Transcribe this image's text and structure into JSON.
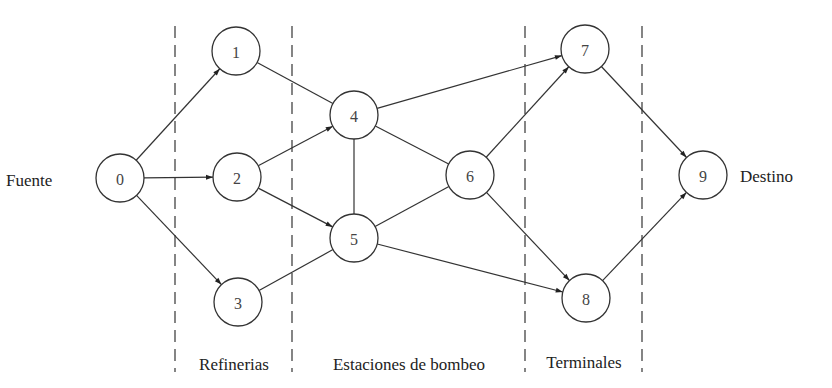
{
  "diagram": {
    "type": "network-flow",
    "source_label": "Fuente",
    "sink_label": "Destino",
    "stages": [
      {
        "label": "Refinerias",
        "x": 234
      },
      {
        "label": "Estaciones de bombeo",
        "x": 409
      },
      {
        "label": "Terminales",
        "x": 584
      }
    ],
    "dividers_x": [
      175,
      292,
      525,
      642
    ],
    "nodes": [
      {
        "id": "0",
        "label": "0",
        "x": 120,
        "y": 178
      },
      {
        "id": "1",
        "label": "1",
        "x": 236,
        "y": 51
      },
      {
        "id": "2",
        "label": "2",
        "x": 237,
        "y": 177
      },
      {
        "id": "3",
        "label": "3",
        "x": 238,
        "y": 302
      },
      {
        "id": "4",
        "label": "4",
        "x": 354,
        "y": 115
      },
      {
        "id": "5",
        "label": "5",
        "x": 354,
        "y": 238
      },
      {
        "id": "6",
        "label": "6",
        "x": 470,
        "y": 175
      },
      {
        "id": "7",
        "label": "7",
        "x": 585,
        "y": 49
      },
      {
        "id": "8",
        "label": "8",
        "x": 586,
        "y": 298
      },
      {
        "id": "9",
        "label": "9",
        "x": 703,
        "y": 175
      }
    ],
    "edges": [
      {
        "from": "0",
        "to": "1",
        "directed": true
      },
      {
        "from": "0",
        "to": "2",
        "directed": true
      },
      {
        "from": "0",
        "to": "3",
        "directed": true
      },
      {
        "from": "1",
        "to": "4",
        "directed": false
      },
      {
        "from": "2",
        "to": "4",
        "directed": true
      },
      {
        "from": "2",
        "to": "5",
        "directed": true
      },
      {
        "from": "3",
        "to": "5",
        "directed": false
      },
      {
        "from": "4",
        "to": "5",
        "directed": false
      },
      {
        "from": "4",
        "to": "6",
        "directed": false
      },
      {
        "from": "5",
        "to": "6",
        "directed": false
      },
      {
        "from": "4",
        "to": "7",
        "directed": true
      },
      {
        "from": "6",
        "to": "7",
        "directed": true
      },
      {
        "from": "6",
        "to": "8",
        "directed": true
      },
      {
        "from": "5",
        "to": "8",
        "directed": true
      },
      {
        "from": "7",
        "to": "9",
        "directed": true
      },
      {
        "from": "8",
        "to": "9",
        "directed": true
      }
    ],
    "node_radius": 24
  }
}
